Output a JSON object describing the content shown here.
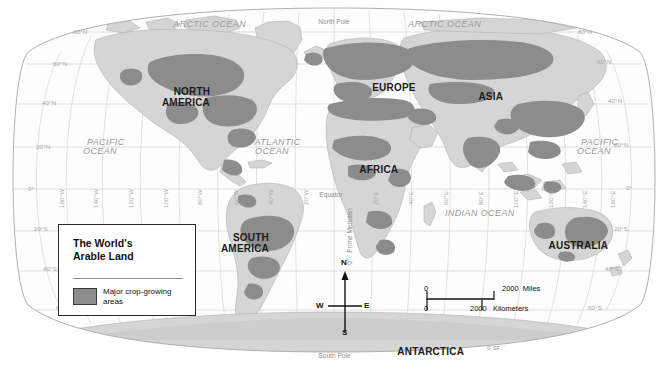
{
  "map": {
    "title": "The World's Arable Land",
    "projection_note": "oval world map",
    "colors": {
      "land_base": "#d6d6d6",
      "crop_area": "#8c8c8c",
      "ocean": "#fdfdfd",
      "graticule": "#c9c9c9",
      "outline": "#9d9d9d",
      "text_dark": "#111111",
      "text_grey": "#9a9a9a"
    }
  },
  "legend": {
    "title_line1": "The World's",
    "title_line2": "Arable Land",
    "swatch_label_line1": "Major crop-growing",
    "swatch_label_line2": "areas",
    "swatch_color": "#8c8c8c"
  },
  "continents": [
    {
      "name": "NORTH\nAMERICA",
      "x": 186,
      "y": 82
    },
    {
      "name": "SOUTH\nAMERICA",
      "x": 245,
      "y": 228
    },
    {
      "name": "EUROPE",
      "x": 388,
      "y": 77
    },
    {
      "name": "ASIA",
      "x": 485,
      "y": 86
    },
    {
      "name": "AFRICA",
      "x": 373,
      "y": 159
    },
    {
      "name": "AUSTRALIA",
      "x": 572,
      "y": 235
    },
    {
      "name": "ANTARCTICA",
      "x": 425,
      "y": 341
    }
  ],
  "oceans": [
    {
      "name": "ARCTIC OCEAN",
      "x": 204,
      "y": 14
    },
    {
      "name": "ARCTIC OCEAN",
      "x": 439,
      "y": 14
    },
    {
      "name": "PACIFIC\nOCEAN",
      "x": 100,
      "y": 136
    },
    {
      "name": "PACIFIC\nOCEAN",
      "x": 594,
      "y": 136
    },
    {
      "name": "ATLANTIC\nOCEAN",
      "x": 272,
      "y": 136
    },
    {
      "name": "INDIAN OCEAN",
      "x": 474,
      "y": 204
    }
  ],
  "annotations": {
    "north_pole": "North Pole",
    "south_pole": "South Pole",
    "equator": "Equator",
    "prime_meridian": "Prime Meridian",
    "prime_meridian_degree": "0°",
    "copyright": "© SF"
  },
  "latitude_labels_left": [
    {
      "text": "80°N",
      "x": 73,
      "y": 32
    },
    {
      "text": "60°N",
      "x": 53,
      "y": 66
    },
    {
      "text": "40°N",
      "x": 42,
      "y": 103
    },
    {
      "text": "20°N",
      "x": 36,
      "y": 148
    },
    {
      "text": "0°",
      "x": 28,
      "y": 190
    },
    {
      "text": "20°S",
      "x": 34,
      "y": 230
    },
    {
      "text": "40°S",
      "x": 43,
      "y": 270
    },
    {
      "text": "60°S",
      "x": 56,
      "y": 309
    }
  ],
  "latitude_labels_right": [
    {
      "text": "80°N",
      "x": 583,
      "y": 32
    },
    {
      "text": "60°N",
      "x": 600,
      "y": 63
    },
    {
      "text": "40°N",
      "x": 611,
      "y": 101
    },
    {
      "text": "20°N",
      "x": 617,
      "y": 146
    },
    {
      "text": "0°",
      "x": 627,
      "y": 189
    },
    {
      "text": "20°S",
      "x": 617,
      "y": 230
    },
    {
      "text": "40°S",
      "x": 608,
      "y": 270
    },
    {
      "text": "60°S",
      "x": 591,
      "y": 309
    }
  ],
  "longitude_labels": [
    {
      "text": "160°W",
      "x": 62,
      "y": 186
    },
    {
      "text": "140°W",
      "x": 96,
      "y": 186
    },
    {
      "text": "120°W",
      "x": 131,
      "y": 186
    },
    {
      "text": "100°W",
      "x": 166,
      "y": 186
    },
    {
      "text": "80°W",
      "x": 200,
      "y": 186
    },
    {
      "text": "60°W",
      "x": 236,
      "y": 186
    },
    {
      "text": "40°W",
      "x": 271,
      "y": 186
    },
    {
      "text": "20°W",
      "x": 306,
      "y": 186
    },
    {
      "text": "20°E",
      "x": 376,
      "y": 186
    },
    {
      "text": "40°E",
      "x": 411,
      "y": 186
    },
    {
      "text": "60°E",
      "x": 446,
      "y": 186
    },
    {
      "text": "80°E",
      "x": 481,
      "y": 186
    },
    {
      "text": "100°E",
      "x": 516,
      "y": 186
    },
    {
      "text": "120°E",
      "x": 551,
      "y": 186
    },
    {
      "text": "140°E",
      "x": 586,
      "y": 186
    },
    {
      "text": "160°E",
      "x": 614,
      "y": 186
    }
  ],
  "compass": {
    "north": "N",
    "south": "S",
    "east": "E",
    "west": "W"
  },
  "scalebar": {
    "miles_zero": "0",
    "miles_value": "2000  Miles",
    "km_zero": "0",
    "km_value": "2000   Kilometers"
  }
}
